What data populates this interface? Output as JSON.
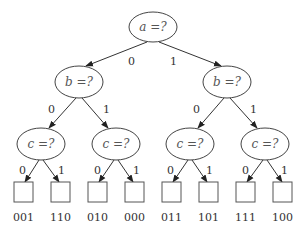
{
  "nodes": {
    "root": {
      "label": "a =?",
      "cx": 153,
      "cy": 27
    },
    "b_left": {
      "label": "b =?",
      "cx": 79,
      "cy": 82
    },
    "b_right": {
      "label": "b =?",
      "cx": 227,
      "cy": 82
    },
    "c1": {
      "label": "c =?",
      "cx": 41,
      "cy": 144
    },
    "c2": {
      "label": "c =?",
      "cx": 116,
      "cy": 144
    },
    "c3": {
      "label": "c =?",
      "cx": 190,
      "cy": 144
    },
    "c4": {
      "label": "c =?",
      "cx": 265,
      "cy": 144
    }
  },
  "edge_labels": {
    "root_0": "0",
    "root_1": "1",
    "bl_0": "0",
    "bl_1": "1",
    "br_0": "0",
    "br_1": "1",
    "c1_0": "0",
    "c1_1": "1",
    "c2_0": "0",
    "c2_1": "1",
    "c3_0": "0",
    "c3_1": "1",
    "c4_0": "0",
    "c4_1": "1"
  },
  "leaves": [
    "001",
    "110",
    "010",
    "000",
    "011",
    "101",
    "111",
    "100"
  ],
  "colors": {
    "stroke": "#444444",
    "text": "#333333",
    "background": "#ffffff"
  }
}
